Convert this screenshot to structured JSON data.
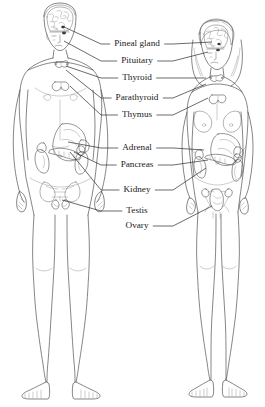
{
  "diagram": {
    "background_color": "#ffffff",
    "ink_color": "#3a3a3a",
    "text_color": "#1a1a1a",
    "width": 265,
    "height": 407
  },
  "labels": [
    {
      "id": "pineal-gland",
      "text": "Pineal gland",
      "y": 44,
      "text_anchor_x": 172,
      "left_line": true,
      "right_line": true,
      "male_target_x": 62,
      "male_target_y": 26,
      "female_target_x": 212,
      "female_target_y": 42
    },
    {
      "id": "pituitary",
      "text": "Pituitary",
      "y": 61,
      "text_anchor_x": 172,
      "left_line": true,
      "right_line": true,
      "male_target_x": 64,
      "male_target_y": 41,
      "female_target_x": 208,
      "female_target_y": 52
    },
    {
      "id": "thyroid",
      "text": "Thyroid",
      "y": 78,
      "text_anchor_x": 172,
      "left_line": true,
      "right_line": true,
      "male_target_x": 66,
      "male_target_y": 66,
      "female_target_x": 206,
      "female_target_y": 78
    },
    {
      "id": "parathyroid",
      "text": "Parathyroid",
      "y": 98,
      "text_anchor_x": 172,
      "left_line": true,
      "right_line": true,
      "male_target_x": 66,
      "male_target_y": 70,
      "female_target_x": 206,
      "female_target_y": 84
    },
    {
      "id": "thymus",
      "text": "Thymus",
      "y": 115,
      "text_anchor_x": 172,
      "left_line": true,
      "right_line": true,
      "male_target_x": 70,
      "male_target_y": 86,
      "female_target_x": 208,
      "female_target_y": 98
    },
    {
      "id": "adrenal",
      "text": "Adrenal",
      "y": 148,
      "text_anchor_x": 172,
      "left_line": true,
      "right_line": true,
      "male_target_x": 68,
      "male_target_y": 142,
      "female_target_x": 204,
      "female_target_y": 150
    },
    {
      "id": "pancreas",
      "text": "Pancreas",
      "y": 165,
      "text_anchor_x": 172,
      "left_line": true,
      "right_line": true,
      "male_target_x": 74,
      "male_target_y": 152,
      "female_target_x": 208,
      "female_target_y": 160
    },
    {
      "id": "kidney",
      "text": "Kidney",
      "y": 190,
      "text_anchor_x": 172,
      "left_line": true,
      "right_line": true,
      "male_target_x": 70,
      "male_target_y": 152,
      "female_target_x": 206,
      "female_target_y": 168
    },
    {
      "id": "testis",
      "text": "Testis",
      "y": 211,
      "text_anchor_x": 172,
      "left_line": true,
      "right_line": false,
      "male_target_x": 62,
      "male_target_y": 200,
      "female_target_x": null,
      "female_target_y": null
    },
    {
      "id": "ovary",
      "text": "Ovary",
      "y": 226,
      "text_anchor_x": 172,
      "left_line": false,
      "right_line": true,
      "male_target_x": null,
      "male_target_y": null,
      "female_target_x": 212,
      "female_target_y": 206
    }
  ],
  "figures": [
    {
      "id": "male-figure",
      "sex": "male",
      "side": "left",
      "description": "Standing nude male figure, front view, short hair, head shown in cutaway revealing brain"
    },
    {
      "id": "female-figure",
      "sex": "female",
      "side": "right",
      "description": "Standing nude female figure, front view, long hair, head shown in cutaway revealing brain"
    }
  ]
}
